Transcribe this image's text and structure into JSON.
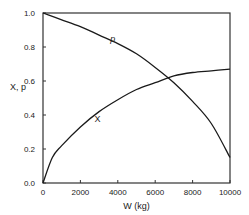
{
  "chart_data": {
    "type": "line",
    "title": "",
    "xlabel": "W (kg)",
    "ylabel": "X, p",
    "xlim": [
      0,
      10000
    ],
    "ylim": [
      0.0,
      1.0
    ],
    "grid": false,
    "legend": "inline labels",
    "x_ticks": [
      "0",
      "2000",
      "4000",
      "6000",
      "8000",
      "10000"
    ],
    "y_ticks": [
      "0.0",
      "0.2",
      "0.4",
      "0.6",
      "0.8",
      "1.0"
    ],
    "x": [
      0,
      500,
      1000,
      2000,
      3000,
      4000,
      5000,
      6000,
      7000,
      8000,
      9000,
      10000
    ],
    "series": [
      {
        "name": "p",
        "values": [
          1.0,
          0.98,
          0.96,
          0.92,
          0.87,
          0.82,
          0.76,
          0.68,
          0.59,
          0.48,
          0.35,
          0.15
        ]
      },
      {
        "name": "X",
        "values": [
          0.0,
          0.15,
          0.22,
          0.33,
          0.42,
          0.49,
          0.55,
          0.59,
          0.63,
          0.65,
          0.66,
          0.67
        ]
      }
    ],
    "annotations": [
      {
        "text": "p",
        "x": 3600,
        "y": 0.83
      },
      {
        "text": "X",
        "x": 2750,
        "y": 0.36
      }
    ]
  }
}
